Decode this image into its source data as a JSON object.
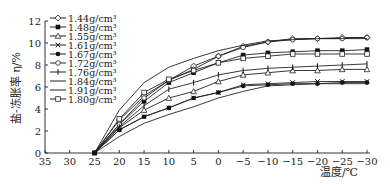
{
  "chart_data": {
    "type": "line",
    "title": "",
    "xlabel": "温度/℃",
    "ylabel": "盐-冻胀率 η/%",
    "x": [
      25,
      20,
      15,
      10,
      5,
      0,
      -5,
      -10,
      -15,
      -20,
      -25,
      -30
    ],
    "xticks": [
      35,
      30,
      25,
      20,
      15,
      10,
      5,
      0,
      -5,
      -10,
      -15,
      -20,
      -25,
      -30
    ],
    "xlim": [
      35,
      -30
    ],
    "yticks": [
      0,
      2,
      4,
      6,
      8,
      10,
      12
    ],
    "ylim": [
      0,
      12
    ],
    "grid": false,
    "legend_position": "upper left",
    "series": [
      {
        "name": "1.44g/cm³",
        "marker": "diamond-open",
        "values": [
          0,
          3.0,
          5.2,
          6.6,
          7.9,
          8.8,
          9.7,
          10.1,
          10.4,
          10.4,
          10.5,
          10.5
        ]
      },
      {
        "name": "1.48g/cm³",
        "marker": "square-filled",
        "values": [
          0,
          2.6,
          4.7,
          6.4,
          7.3,
          8.2,
          8.9,
          9.1,
          9.2,
          9.3,
          9.3,
          9.4
        ]
      },
      {
        "name": "1.55g/cm³",
        "marker": "triangle-open",
        "values": [
          0,
          2.3,
          3.9,
          5.0,
          5.6,
          6.5,
          7.1,
          7.3,
          7.5,
          7.5,
          7.6,
          7.6
        ]
      },
      {
        "name": "1.61g/cm³",
        "marker": "cross",
        "values": [
          0,
          2.1,
          3.3,
          4.1,
          5.0,
          5.5,
          6.2,
          6.3,
          6.4,
          6.5,
          6.5,
          6.5
        ]
      },
      {
        "name": "1.67g/cm³",
        "marker": "star-filled",
        "values": [
          0,
          2.1,
          3.3,
          4.1,
          5.0,
          5.5,
          6.1,
          6.2,
          6.3,
          6.3,
          6.4,
          6.4
        ]
      },
      {
        "name": "1.72g/cm³",
        "marker": "circle-open",
        "values": [
          0,
          2.6,
          5.0,
          6.6,
          7.6,
          8.8,
          9.6,
          10.1,
          10.3,
          10.4,
          10.4,
          10.5
        ]
      },
      {
        "name": "1.76g/cm³",
        "marker": "plus",
        "values": [
          0,
          2.4,
          4.3,
          5.8,
          6.4,
          7.1,
          7.5,
          7.7,
          7.8,
          7.9,
          8.0,
          8.1
        ]
      },
      {
        "name": "1.84g/cm³",
        "marker": "none",
        "values": [
          0,
          3.9,
          6.4,
          7.8,
          8.6,
          9.3,
          9.8,
          10.2,
          10.3,
          10.4,
          10.4,
          10.4
        ]
      },
      {
        "name": "1.91g/cm³",
        "marker": "none",
        "values": [
          0,
          1.5,
          2.7,
          3.5,
          4.2,
          5.0,
          5.6,
          6.1,
          6.2,
          6.3,
          6.3,
          6.3
        ]
      },
      {
        "name": "1.80g/cm³",
        "marker": "square-open",
        "values": [
          0,
          3.1,
          5.5,
          6.7,
          7.5,
          8.2,
          8.6,
          8.8,
          9.0,
          9.0,
          9.0,
          9.0
        ]
      }
    ]
  }
}
